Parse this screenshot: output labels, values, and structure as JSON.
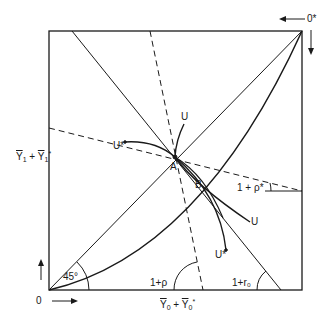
{
  "diagram": {
    "origin_label": "0",
    "origin_star_label": "0*",
    "y_axis_label": {
      "main": "Y",
      "sub": "1",
      "plus": "+",
      "main2": "Y",
      "sub2": "1",
      "sup2": "*"
    },
    "x_axis_label": {
      "main": "Y",
      "sub": "0",
      "plus": "+",
      "main2": "Y",
      "sub2": "0",
      "sup2": "*"
    },
    "angle_45": "45°",
    "angle_rho": "1+ρ",
    "angle_r0": "1+r₀",
    "angle_rho_star": "1 + ρ*",
    "point_a": "A",
    "point_b": "B",
    "curve_u_top": "U",
    "curve_u_star_left": "U*",
    "curve_u_right": "U",
    "curve_u_star_bottom": "U*"
  }
}
